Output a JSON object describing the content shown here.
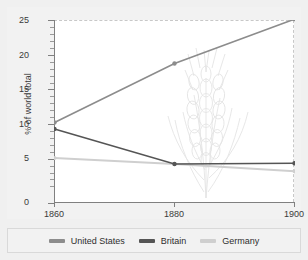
{
  "chart_data": {
    "type": "line",
    "title": "",
    "xlabel": "",
    "ylabel": "% of world total",
    "x": [
      1860,
      1880,
      1900
    ],
    "xtick_labels": [
      "1860",
      "1880",
      "1900"
    ],
    "xlim": [
      1857,
      1903
    ],
    "ylim": [
      0,
      26.5
    ],
    "ytick_labels": [
      "0",
      "5",
      "10",
      "15",
      "20",
      "25"
    ],
    "ytick_values": [
      0,
      5,
      10,
      15,
      20,
      25
    ],
    "yminor_step": 1,
    "grid": false,
    "legend_position": "bottom",
    "annotation": "wheat-stalk watermark in plot area",
    "series": [
      {
        "name": "United States",
        "color": "#8c8c8c",
        "values": [
          11.0,
          19.1,
          25.2
        ]
      },
      {
        "name": "Britain",
        "color": "#555555",
        "values": [
          10.1,
          5.3,
          5.4
        ]
      },
      {
        "name": "Germany",
        "color": "#cfcfcf",
        "values": [
          6.1,
          5.3,
          4.3
        ]
      }
    ]
  },
  "axes": {
    "y_title": "% of world total",
    "y_ticks": [
      {
        "label": "25",
        "value": 25
      },
      {
        "label": "20",
        "value": 20
      },
      {
        "label": "15",
        "value": 15
      },
      {
        "label": "10",
        "value": 10
      },
      {
        "label": "5",
        "value": 5
      },
      {
        "label": "0",
        "value": 0
      }
    ],
    "x_ticks": [
      {
        "label": "1860",
        "value": 1860
      },
      {
        "label": "1880",
        "value": 1880
      },
      {
        "label": "1900",
        "value": 1900
      }
    ]
  },
  "legend": {
    "items": [
      {
        "label": "United States",
        "color": "#8c8c8c"
      },
      {
        "label": "Britain",
        "color": "#555555"
      },
      {
        "label": "Germany",
        "color": "#cfcfcf"
      }
    ]
  },
  "colors": {
    "page_background": "#ffffff",
    "panel_background": "#f2f2f2",
    "plot_background": "#ffffff",
    "axis": "#808080",
    "text": "#3a3a3a",
    "united_states": "#8c8c8c",
    "britain": "#555555",
    "germany": "#cfcfcf",
    "watermark": "#e3e3e3"
  }
}
